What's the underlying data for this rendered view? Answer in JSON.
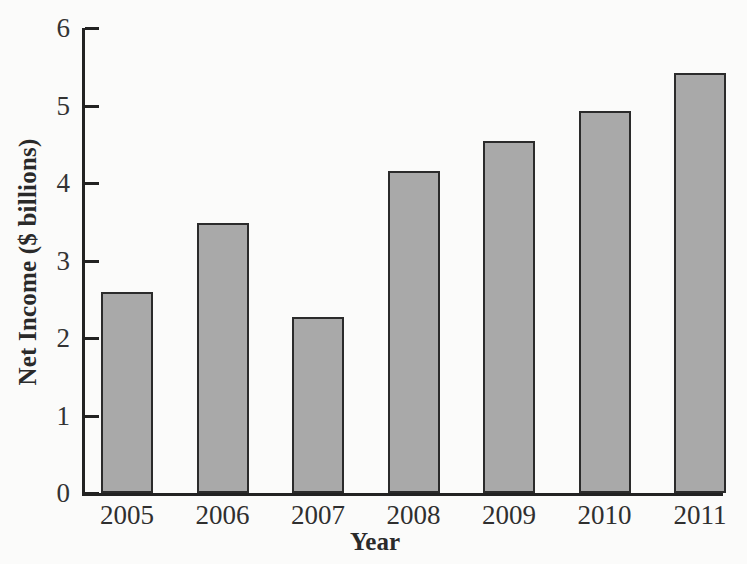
{
  "chart_data": {
    "type": "bar",
    "title": "",
    "categories": [
      "2005",
      "2006",
      "2007",
      "2008",
      "2009",
      "2010",
      "2011"
    ],
    "values": [
      2.6,
      3.48,
      2.27,
      4.16,
      4.54,
      4.93,
      5.42
    ],
    "xlabel": "Year",
    "ylabel": "Net Income ($ billions)",
    "ylim": [
      0,
      6
    ],
    "yticks": [
      0,
      1,
      2,
      3,
      4,
      5,
      6
    ],
    "ytick_labels": [
      "0",
      "1",
      "2",
      "3",
      "4",
      "5",
      "6"
    ],
    "grid": false,
    "legend": false,
    "bar_fill_color": "#a9a9a9",
    "bar_edge_color": "#2b2b2b",
    "axis_color": "#222222",
    "background_color": "#fbfbfa"
  }
}
